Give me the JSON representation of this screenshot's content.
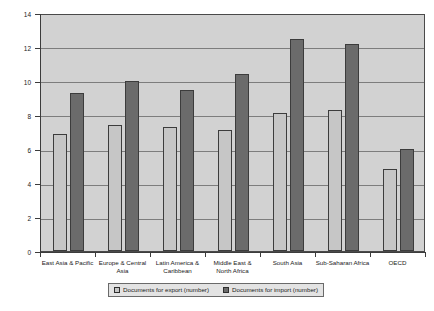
{
  "chart_data": {
    "type": "bar",
    "title": "",
    "xlabel": "",
    "ylabel": "",
    "ylim": [
      0,
      14
    ],
    "yticks": [
      0,
      2,
      4,
      6,
      8,
      10,
      12,
      14
    ],
    "grid": true,
    "legend_position": "bottom",
    "categories": [
      "East Asia & Pacific",
      "Europe & Central Asia",
      "Latin America & Caribbean",
      "Middle East & North Africa",
      "South Asia",
      "Sub-Saharan Africa",
      "OECD"
    ],
    "series": [
      {
        "name": "Documents for export (number)",
        "color": "#c6c6c6",
        "values": [
          6.9,
          7.4,
          7.3,
          7.1,
          8.1,
          8.3,
          4.8
        ]
      },
      {
        "name": "Documents for import (number)",
        "color": "#6b6b6b",
        "values": [
          9.3,
          10.0,
          9.5,
          10.4,
          12.5,
          12.2,
          6.0
        ]
      }
    ]
  },
  "legend": {
    "items": [
      {
        "label": "Documents for export (number)"
      },
      {
        "label": "Documents for import (number)"
      }
    ]
  }
}
